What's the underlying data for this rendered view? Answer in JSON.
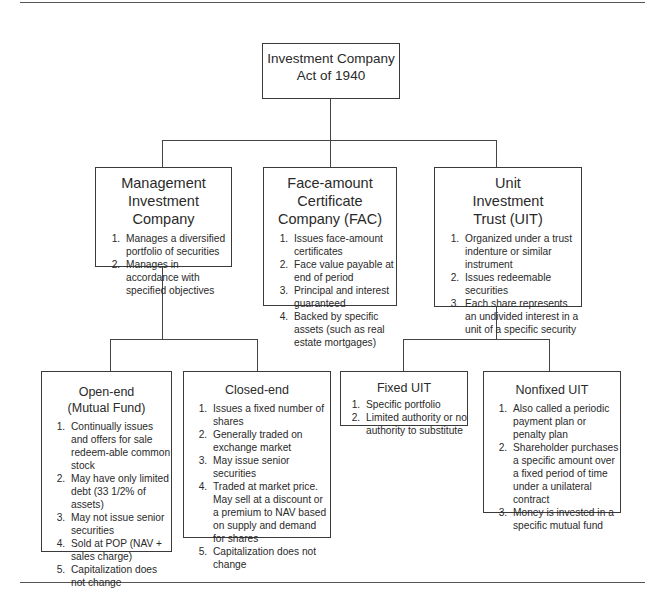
{
  "root": {
    "title": "Investment Company\nAct of 1940"
  },
  "level1": [
    {
      "title": "Management\nInvestment\nCompany",
      "items": [
        "Manages a diversified portfolio of securities",
        "Manages in accordance with specified objectives"
      ]
    },
    {
      "title": "Face-amount\nCertificate\nCompany (FAC)",
      "items": [
        "Issues face-amount certificates",
        "Face value payable at end of period",
        "Principal and interest guaranteed",
        "Backed by specific assets (such as real estate mortgages)"
      ]
    },
    {
      "title": "Unit\nInvestment\nTrust (UIT)",
      "items": [
        "Organized under a trust indenture or similar instrument",
        "Issues redeemable securities",
        "Each share represents an undivided interest in a unit of a specific security"
      ]
    }
  ],
  "level2": [
    {
      "title": "Open-end\n(Mutual Fund)",
      "items": [
        "Continually issues and offers for sale redeem-able common stock",
        "May have only limited debt (33 1/2% of assets)",
        "May not issue senior securities",
        "Sold at POP (NAV + sales charge)",
        "Capitalization does not change"
      ]
    },
    {
      "title": "Closed-end",
      "items": [
        "Issues a fixed number of shares",
        "Generally traded on exchange market",
        "May issue senior securities",
        "Traded at market price. May sell at a discount or a premium to NAV based on supply and demand for shares",
        "Capitalization does not change"
      ]
    },
    {
      "title": "Fixed UIT",
      "items": [
        "Specific portfolio",
        "Limited authority or no authority to substitute"
      ]
    },
    {
      "title": "Nonfixed UIT",
      "items": [
        "Also called a periodic payment plan or penalty plan",
        "Shareholder purchases a specific amount over a fixed period of time under a unilateral contract",
        "Money is invested in a specific mutual fund"
      ]
    }
  ]
}
